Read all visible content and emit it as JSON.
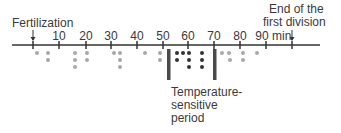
{
  "labels": {
    "fertilization": "Fertilization",
    "end_line1": "End of the",
    "end_line2": "first division",
    "unit": "min",
    "temp_line1": "Temperature-",
    "temp_line2": "sensitive",
    "temp_line3": "period"
  },
  "axis": {
    "ticks": [
      {
        "value": "10",
        "x": 59
      },
      {
        "value": "20",
        "x": 86
      },
      {
        "value": "30",
        "x": 111
      },
      {
        "value": "40",
        "x": 137
      },
      {
        "value": "50",
        "x": 163
      },
      {
        "value": "60",
        "x": 188
      },
      {
        "value": "70",
        "x": 214
      },
      {
        "value": "80",
        "x": 240
      },
      {
        "value": "90",
        "x": 264
      }
    ],
    "fertilization_x": 33,
    "end_x": 292
  },
  "colors": {
    "axis": "#333333",
    "light_dot": "#a8a8a8",
    "dark_dot": "#333333",
    "bar": "#4a4a4a"
  },
  "temperature_sensitive_period": {
    "start_min": 52,
    "end_min": 70
  }
}
